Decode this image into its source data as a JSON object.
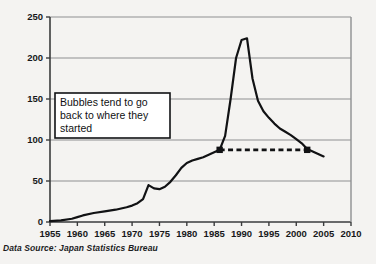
{
  "source_note": "Data Source: Japan Statistics Bureau",
  "annotation": {
    "line1": "Bubbles tend to go",
    "line2": "back to where they",
    "line3": "started"
  },
  "colors": {
    "background": "#f4f3f1",
    "plot_background": "#f4f3f1",
    "line": "#111214",
    "grid": "#8d8f91",
    "axis": "#3a3b3d",
    "text": "#17181a",
    "annotation_box_fill": "#ffffff",
    "annotation_box_border": "#111214"
  },
  "chart_data": {
    "type": "line",
    "title": "",
    "subtitle": "",
    "xlabel": "",
    "ylabel": "",
    "xlim": [
      1955,
      2010
    ],
    "ylim": [
      0,
      250
    ],
    "grid": true,
    "grid_axis": "y",
    "legend": false,
    "legend_position": "none",
    "x_ticks": [
      1955,
      1960,
      1965,
      1970,
      1975,
      1980,
      1985,
      1990,
      1995,
      2000,
      2005,
      2010
    ],
    "x_tick_labels": [
      "1955",
      "1960",
      "1965",
      "1970",
      "1975",
      "1980",
      "1985",
      "1990",
      "1995",
      "2000",
      "2005",
      "2010"
    ],
    "y_ticks": [
      0,
      50,
      100,
      150,
      200,
      250
    ],
    "y_tick_labels": [
      "0",
      "50",
      "100",
      "150",
      "200",
      "250"
    ],
    "series": [
      {
        "name": "Japan land price index",
        "x": [
          1955,
          1957,
          1959,
          1960,
          1961,
          1963,
          1965,
          1967,
          1969,
          1970,
          1971,
          1972,
          1973,
          1974,
          1975,
          1976,
          1977,
          1978,
          1979,
          1980,
          1981,
          1982,
          1983,
          1984,
          1985,
          1986,
          1987,
          1988,
          1989,
          1990,
          1991,
          1992,
          1993,
          1994,
          1995,
          1996,
          1997,
          1998,
          1999,
          2000,
          2001,
          2002,
          2003,
          2004,
          2005
        ],
        "y": [
          1,
          2,
          4,
          6,
          8,
          11,
          13,
          15,
          18,
          20,
          23,
          28,
          45,
          41,
          40,
          43,
          49,
          57,
          66,
          72,
          75,
          77,
          79,
          82,
          85,
          88,
          105,
          150,
          200,
          222,
          224,
          175,
          148,
          135,
          127,
          120,
          114,
          110,
          106,
          101,
          96,
          89,
          86,
          83,
          80
        ]
      }
    ],
    "reference_line": {
      "style": "dashed",
      "y": 88,
      "x_start": 1986,
      "x_end": 2002,
      "markers": [
        {
          "x": 1986,
          "y": 88
        },
        {
          "x": 2002,
          "y": 88
        }
      ]
    },
    "annotations": [
      {
        "text": "Bubbles tend to go back to where they started",
        "x_range": [
          1956.5,
          1973
        ],
        "y_range": [
          104,
          152
        ],
        "boxed": true
      }
    ]
  }
}
